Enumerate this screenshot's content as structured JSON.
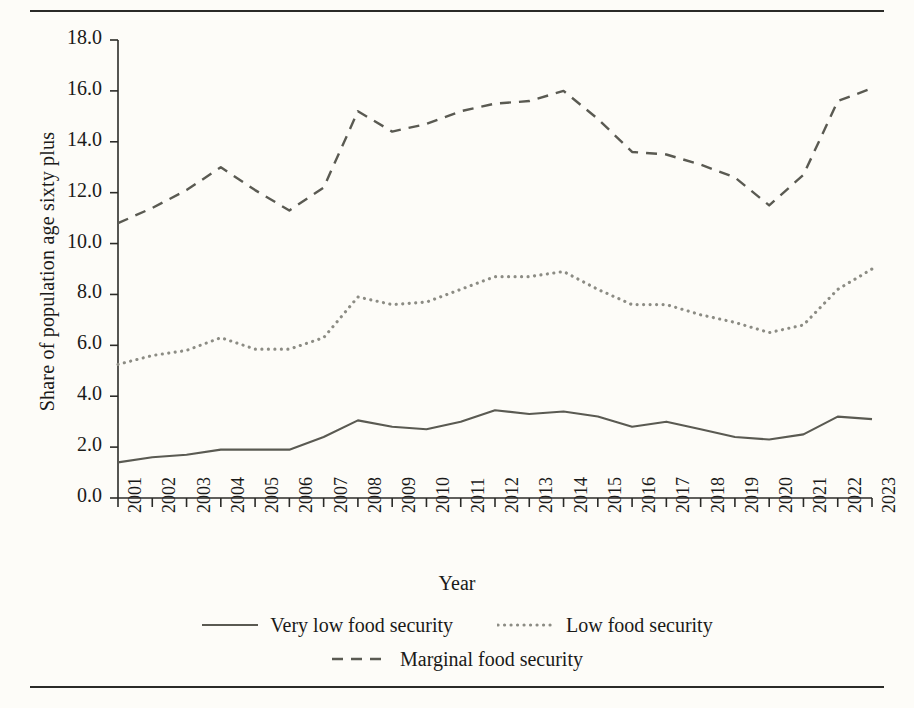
{
  "chart_data": {
    "type": "line",
    "title": "",
    "xlabel": "Year",
    "ylabel": "Share of population age sixty plus",
    "categories": [
      "2001",
      "2002",
      "2003",
      "2004",
      "2005",
      "2006",
      "2007",
      "2008",
      "2009",
      "2010",
      "2011",
      "2012",
      "2013",
      "2014",
      "2015",
      "2016",
      "2017",
      "2018",
      "2019",
      "2020",
      "2021",
      "2022",
      "2023"
    ],
    "x": [
      2001,
      2002,
      2003,
      2004,
      2005,
      2006,
      2007,
      2008,
      2009,
      2010,
      2011,
      2012,
      2013,
      2014,
      2015,
      2016,
      2017,
      2018,
      2019,
      2020,
      2021,
      2022,
      2023
    ],
    "ylim": [
      0,
      18
    ],
    "xlim": [
      2001,
      2023
    ],
    "yticks": [
      "0.0",
      "2.0",
      "4.0",
      "6.0",
      "8.0",
      "10.0",
      "12.0",
      "14.0",
      "16.0",
      "18.0"
    ],
    "ytick_values": [
      0,
      2,
      4,
      6,
      8,
      10,
      12,
      14,
      16,
      18
    ],
    "grid": false,
    "legend_position": "bottom",
    "series": [
      {
        "name": "Very low food security",
        "style": "solid",
        "color": "#5a5a52",
        "values": [
          1.4,
          1.6,
          1.7,
          1.9,
          1.9,
          1.9,
          2.4,
          3.05,
          2.8,
          2.7,
          3.0,
          3.45,
          3.3,
          3.4,
          3.2,
          2.8,
          3.0,
          2.7,
          2.4,
          2.3,
          2.5,
          3.2,
          3.1
        ]
      },
      {
        "name": "Low food security",
        "style": "dotted",
        "color": "#8c8c84",
        "values": [
          5.25,
          5.6,
          5.8,
          6.3,
          5.85,
          5.85,
          6.3,
          7.9,
          7.6,
          7.7,
          8.2,
          8.7,
          8.7,
          8.9,
          8.2,
          7.6,
          7.6,
          7.2,
          6.9,
          6.5,
          6.8,
          8.2,
          9.0
        ]
      },
      {
        "name": "Marginal food security",
        "style": "dashed",
        "color": "#5a5a52",
        "values": [
          10.8,
          11.4,
          12.1,
          13.0,
          12.1,
          11.3,
          12.2,
          15.2,
          14.4,
          14.7,
          15.2,
          15.5,
          15.6,
          16.0,
          14.9,
          13.6,
          13.5,
          13.1,
          12.6,
          11.5,
          12.7,
          15.6,
          16.1
        ]
      }
    ]
  },
  "legend": {
    "rows": [
      [
        {
          "label": "Very low food security",
          "style": "solid"
        },
        {
          "label": "Low food security",
          "style": "dotted"
        }
      ],
      [
        {
          "label": "Marginal food security",
          "style": "dashed"
        }
      ]
    ]
  }
}
